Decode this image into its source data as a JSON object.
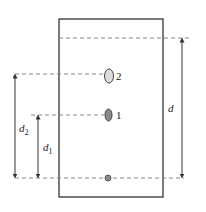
{
  "diagram": {
    "type": "thin-layer-chromatography-plate",
    "colors": {
      "outline": "#333333",
      "dashed": "#888888",
      "spot2_fill": "#dcdcdc",
      "spot1_fill": "#8a8a8a",
      "origin_fill": "#8a8a8a",
      "background": "#ffffff"
    },
    "spots": [
      {
        "label": "2",
        "role": "component-2"
      },
      {
        "label": "1",
        "role": "component-1"
      },
      {
        "label": "",
        "role": "origin"
      }
    ],
    "distances": {
      "d": {
        "main": "d",
        "sub": ""
      },
      "d1": {
        "main": "d",
        "sub": "1"
      },
      "d2": {
        "main": "d",
        "sub": "2"
      }
    }
  }
}
